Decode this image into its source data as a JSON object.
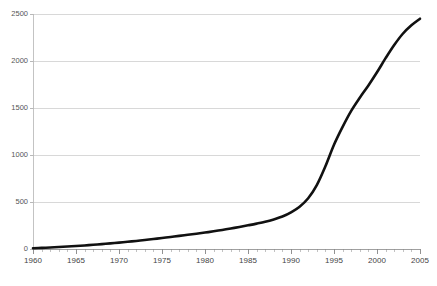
{
  "chart_data": {
    "type": "line",
    "title": "",
    "subtitle": "",
    "xlabel": "",
    "ylabel": "",
    "xlim": [
      1960,
      2005
    ],
    "ylim": [
      0,
      2500
    ],
    "grid": true,
    "legend": false,
    "legend_position": "none",
    "line_color": "#111111",
    "grid_color": "#c8c8c8",
    "axis_color": "#b4b4b4",
    "background_color": "#ffffff",
    "x_tick_labels": [
      "1960",
      "1965",
      "1970",
      "1975",
      "1980",
      "1985",
      "1990",
      "1995",
      "2000",
      "2005"
    ],
    "x_tick_values": [
      1960,
      1965,
      1970,
      1975,
      1980,
      1985,
      1990,
      1995,
      2000,
      2005
    ],
    "x_minor_tick_interval": 1,
    "y_tick_labels": [
      "0",
      "500",
      "1000",
      "1500",
      "2000",
      "2500"
    ],
    "y_tick_values": [
      0,
      500,
      1000,
      1500,
      2000,
      2500
    ],
    "series": [
      {
        "name": "series-1",
        "color": "#111111",
        "x": [
          1960,
          1961,
          1962,
          1963,
          1964,
          1965,
          1966,
          1967,
          1968,
          1969,
          1970,
          1971,
          1972,
          1973,
          1974,
          1975,
          1976,
          1977,
          1978,
          1979,
          1980,
          1981,
          1982,
          1983,
          1984,
          1985,
          1986,
          1987,
          1988,
          1989,
          1990,
          1991,
          1992,
          1993,
          1994,
          1995,
          1996,
          1997,
          1998,
          1999,
          2000,
          2001,
          2002,
          2003,
          2004,
          2005
        ],
        "values": [
          8,
          12,
          16,
          21,
          26,
          32,
          38,
          45,
          52,
          60,
          68,
          77,
          86,
          96,
          106,
          117,
          128,
          140,
          152,
          163,
          175,
          188,
          202,
          218,
          235,
          252,
          270,
          290,
          315,
          345,
          390,
          450,
          540,
          680,
          880,
          1110,
          1300,
          1470,
          1610,
          1740,
          1880,
          2030,
          2170,
          2290,
          2380,
          2450
        ]
      }
    ]
  },
  "axes": {
    "y_axis_name": "value-axis",
    "x_axis_name": "year-axis"
  },
  "caption": {
    "ghost_text": ""
  }
}
